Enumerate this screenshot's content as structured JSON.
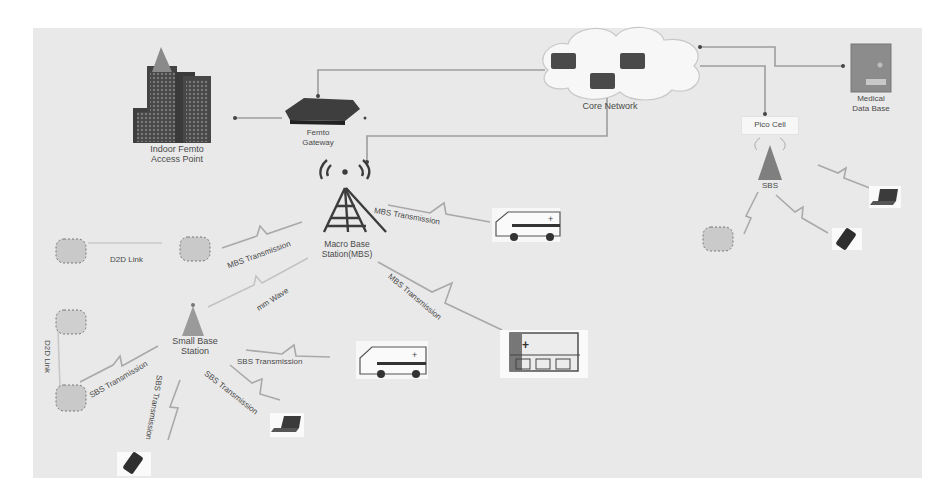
{
  "diagram": {
    "background": "#e9e9e9",
    "nodes": {
      "indoor_femto": {
        "label_line1": "Indoor Femto",
        "label_line2": "Access Point"
      },
      "femto_gateway": {
        "label_line1": "Femto",
        "label_line2": "Gateway"
      },
      "core_network": {
        "label": "Core Network"
      },
      "medical_db": {
        "label_line1": "Medical",
        "label_line2": "Data Base"
      },
      "pico_cell": {
        "label": "Pico Cell"
      },
      "pico_sbs": {
        "label": "SBS"
      },
      "macro_bs": {
        "label_line1": "Macro Base",
        "label_line2": "Station(MBS)"
      },
      "small_bs": {
        "label_line1": "Small Base",
        "label_line2": "Station"
      }
    },
    "links": {
      "d2d_top": "D2D Link",
      "d2d_left": "D2D Link",
      "mbs_to_device": "MBS Transmission",
      "mbs_to_ambulance": "MBS Transmission",
      "mbs_to_hospital": "MBS Transmission",
      "mmwave": "mm Wave",
      "sbs_to_ambulance": "SBS Transmission",
      "sbs_to_device": "SBS Transmission",
      "sbs_to_phone": "SBS Transmission",
      "sbs_to_laptop": "SBS Transmission"
    },
    "colors": {
      "line": "#9a9a9a",
      "dark_icon": "#3d3d3d",
      "tower_fill": "#8a8a8a",
      "db_fill": "#8c8c8c",
      "cloud": "#f6f6f6"
    }
  }
}
